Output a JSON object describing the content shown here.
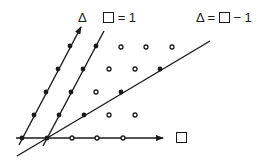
{
  "diagram": {
    "title_labels": {
      "delta_axis": "Δ",
      "line_square_eq_1": {
        "lhs_symbol": "square",
        "rhs": "= 1"
      },
      "line_delta_eq_square_minus_1": {
        "lhs": "Δ",
        "mid": " = ",
        "symbol": "square",
        "rhs": " − 1"
      },
      "square_axis": {
        "symbol": "square"
      }
    },
    "colors": {
      "stroke": "#1a1a1a",
      "background": "#ffffff"
    },
    "origin": [
      22,
      138
    ],
    "square_step": [
      25,
      0
    ],
    "delta_step": [
      12,
      -23
    ],
    "lines": [
      {
        "name": "square-axis",
        "from": [
          16,
          138
        ],
        "to": [
          163,
          138
        ],
        "arrow": true
      },
      {
        "name": "delta-axis",
        "from": [
          19,
          145
        ],
        "to": [
          81,
          27
        ],
        "arrow": true
      },
      {
        "name": "square-eq-1-line",
        "from": [
          43,
          146
        ],
        "to": [
          104,
          31
        ],
        "arrow": false
      },
      {
        "name": "delta-eq-square-minus-1-line",
        "from": [
          17,
          156
        ],
        "to": [
          210,
          41
        ],
        "arrow": false
      }
    ],
    "filled_points": [
      [
        22,
        138
      ],
      [
        34,
        115
      ],
      [
        46,
        92
      ],
      [
        58,
        69
      ],
      [
        70,
        46
      ],
      [
        47,
        138
      ],
      [
        59,
        115
      ],
      [
        71,
        92
      ],
      [
        83,
        69
      ],
      [
        96,
        46
      ],
      [
        84,
        115
      ],
      [
        121,
        92
      ],
      [
        160,
        69
      ]
    ],
    "open_points": [
      [
        72,
        138
      ],
      [
        97,
        138
      ],
      [
        123,
        138
      ],
      [
        109,
        115
      ],
      [
        135,
        115
      ],
      [
        96,
        92
      ],
      [
        109,
        69
      ],
      [
        135,
        69
      ],
      [
        121,
        47
      ],
      [
        146,
        47
      ],
      [
        172,
        47
      ]
    ]
  }
}
